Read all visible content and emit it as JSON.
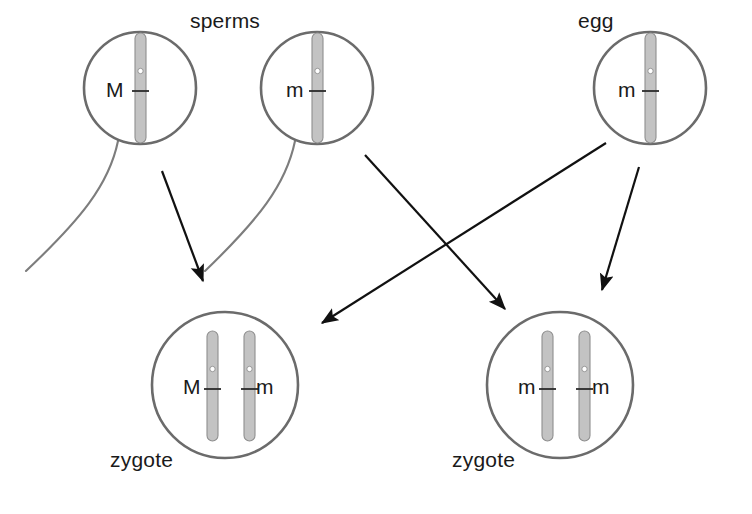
{
  "diagram": {
    "colors": {
      "cell_outline": "#6b6b6b",
      "chromosome_fill": "#c3c3c3",
      "chromosome_outline": "#8f8f8f",
      "arrow": "#111111",
      "tail": "#7d7d7d",
      "text": "#1a1a1a",
      "background": "#ffffff"
    },
    "labels": {
      "sperms": "sperms",
      "egg": "egg",
      "zygote_left": "zygote",
      "zygote_right": "zygote"
    },
    "cells": [
      {
        "id": "sperm-1",
        "kind": "sperm",
        "cx": 140,
        "cy": 88,
        "r": 56,
        "alleles": [
          "M"
        ],
        "chromosome_count": 1,
        "has_tail": true
      },
      {
        "id": "sperm-2",
        "kind": "sperm",
        "cx": 317,
        "cy": 88,
        "r": 56,
        "alleles": [
          "m"
        ],
        "chromosome_count": 1,
        "has_tail": true
      },
      {
        "id": "egg",
        "kind": "egg",
        "cx": 650,
        "cy": 88,
        "r": 56,
        "alleles": [
          "m"
        ],
        "chromosome_count": 1,
        "has_tail": false
      },
      {
        "id": "zygote-left",
        "kind": "zygote",
        "cx": 225,
        "cy": 385,
        "r": 73,
        "alleles": [
          "M",
          "m"
        ],
        "chromosome_count": 2,
        "has_tail": false
      },
      {
        "id": "zygote-right",
        "kind": "zygote",
        "cx": 560,
        "cy": 385,
        "r": 73,
        "alleles": [
          "m",
          "m"
        ],
        "chromosome_count": 2,
        "has_tail": false
      }
    ],
    "alleles": {
      "sperm1": "M",
      "sperm2": "m",
      "egg": "m",
      "zygote_left_1": "M",
      "zygote_left_2": "m",
      "zygote_right_1": "m",
      "zygote_right_2": "m"
    },
    "arrows": [
      {
        "id": "sperm1-to-zygote-left",
        "from": "sperm-1",
        "to": "zygote-left",
        "x1": 162,
        "y1": 171,
        "x2": 203,
        "y2": 283
      },
      {
        "id": "sperm2-to-zygote-right",
        "from": "sperm-2",
        "to": "zygote-right",
        "x1": 365,
        "y1": 155,
        "x2": 506,
        "y2": 311
      },
      {
        "id": "egg-to-zygote-left",
        "from": "egg",
        "to": "zygote-left",
        "x1": 606,
        "y1": 143,
        "x2": 320,
        "y2": 324
      },
      {
        "id": "egg-to-zygote-right",
        "from": "egg",
        "to": "zygote-right",
        "x1": 639,
        "y1": 167,
        "x2": 601,
        "y2": 292
      }
    ]
  }
}
